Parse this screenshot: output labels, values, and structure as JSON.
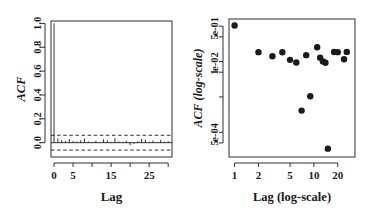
{
  "figure": {
    "type": "multi-panel",
    "panels": 2,
    "background": "#ffffff",
    "ink": "#1a1a1a"
  },
  "chart_data": [
    {
      "id": "acf-linear",
      "type": "bar",
      "title": "",
      "xlabel": "Lag",
      "ylabel": "ACF",
      "xlim": [
        -0.8,
        31
      ],
      "ylim": [
        -0.12,
        1.02
      ],
      "xticks": [
        0,
        5,
        10,
        15,
        20,
        25,
        30
      ],
      "xticklabels": [
        "0",
        "5",
        "",
        "15",
        "",
        "25",
        ""
      ],
      "yticks": [
        0.0,
        0.2,
        0.4,
        0.6,
        0.8,
        1.0
      ],
      "yticklabels": [
        "0.0",
        "0.2",
        "0.4",
        "0.6",
        "0.8",
        "1.0"
      ],
      "grid": false,
      "zero_line": 0.0,
      "confidence_bands": [
        0.062,
        -0.062
      ],
      "confidence_style": "dashed",
      "categories": [
        0,
        1,
        2,
        3,
        4,
        5,
        6,
        7,
        8,
        9,
        10,
        11,
        12,
        13,
        14,
        15,
        16,
        17,
        18,
        19,
        20,
        21,
        22,
        23,
        24,
        25,
        26,
        27,
        28,
        29,
        30
      ],
      "values": [
        1.0,
        0.036,
        0.022,
        0.014,
        0.03,
        0.013,
        0.009,
        0.021,
        0.034,
        0.01,
        0.005,
        0.016,
        0.004,
        0.028,
        0.019,
        0.007,
        0.038,
        0.011,
        0.006,
        0.016,
        -0.021,
        -0.009,
        0.012,
        0.032,
        0.026,
        0.008,
        0.018,
        0.005,
        0.023,
        0.009,
        0.013
      ]
    },
    {
      "id": "acf-loglog",
      "type": "scatter",
      "title": "",
      "xlabel": "Lag (log-scale)",
      "ylabel": "ACF (log-scale)",
      "xscale": "log",
      "yscale": "log",
      "xlim": [
        0.85,
        33
      ],
      "ylim": [
        2e-05,
        0.16
      ],
      "xticks": [
        1,
        2,
        5,
        10,
        20
      ],
      "xticklabels": [
        "1",
        "2",
        "5",
        "10",
        "20"
      ],
      "yticks": [
        0.1,
        0.05,
        0.01,
        0.005,
        0.001,
        0.0001,
        5e-05
      ],
      "yticklabels": [
        "e-01",
        "5",
        "e-02",
        "1",
        "",
        "e-04",
        "5"
      ],
      "grid": false,
      "marker": "filled-circle",
      "marker_size": 3.2,
      "x": [
        1,
        2,
        3,
        4,
        5,
        6,
        7,
        8,
        9,
        11,
        12,
        13,
        14,
        15,
        18,
        20,
        24,
        26
      ],
      "y": [
        0.105,
        0.0185,
        0.0142,
        0.0183,
        0.0112,
        0.0094,
        0.00041,
        0.0152,
        0.00105,
        0.0253,
        0.0129,
        0.0101,
        0.0093,
        3.45e-05,
        0.0186,
        0.0185,
        0.0116,
        0.0188
      ]
    }
  ]
}
